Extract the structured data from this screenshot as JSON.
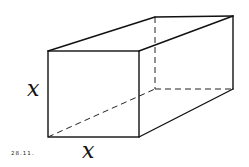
{
  "figure": {
    "caption": "28.11.",
    "labels": {
      "height": "x",
      "width": "x"
    },
    "vertices": {
      "front_top_left": [
        48,
        51
      ],
      "front_top_right": [
        139,
        51
      ],
      "front_bottom_left": [
        48,
        137
      ],
      "front_bottom_right": [
        139,
        137
      ],
      "back_top_left": [
        155,
        17
      ],
      "back_top_right": [
        233,
        16
      ],
      "back_bottom_right": [
        233,
        89
      ],
      "back_bottom_left": [
        155,
        89
      ]
    },
    "colors": {
      "line": "#111111",
      "background": "#ffffff"
    }
  }
}
